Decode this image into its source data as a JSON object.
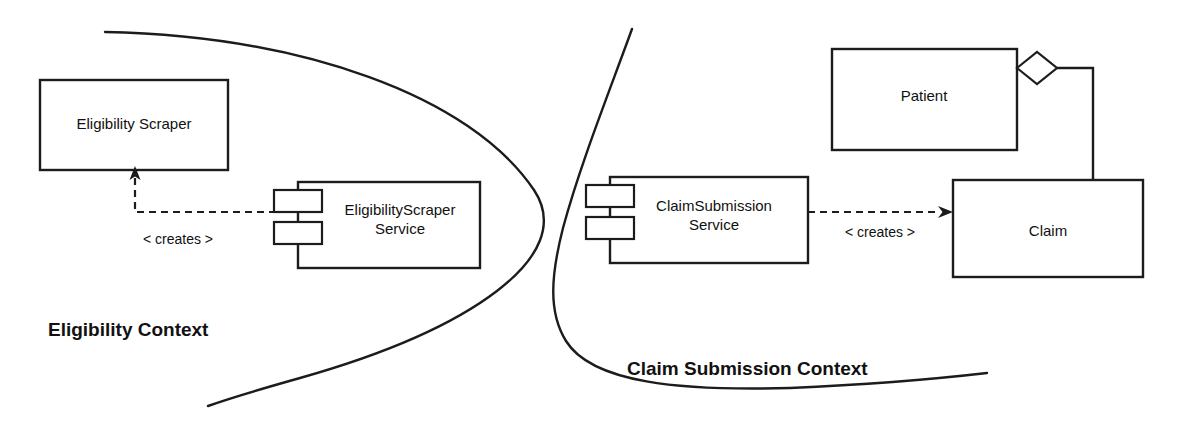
{
  "diagram": {
    "type": "uml-component-context-diagram",
    "background_color": "#ffffff",
    "line_color": "#1c1c1c",
    "contexts": [
      {
        "id": "eligibility",
        "label": "Eligibility Context",
        "label_x": 48,
        "label_y": 328
      },
      {
        "id": "claim-submission",
        "label": "Claim Submission Context",
        "label_x": 627,
        "label_y": 368
      }
    ],
    "nodes": [
      {
        "id": "eligibility-scraper",
        "kind": "class-box",
        "label": "Eligibility Scraper",
        "x": 40,
        "y": 80,
        "width": 188,
        "height": 90
      },
      {
        "id": "eligibility-scraper-service",
        "kind": "component",
        "label_line1": "EligibilityScraper",
        "label_line2": "Service",
        "x": 298,
        "y": 182,
        "width": 182,
        "height": 86
      },
      {
        "id": "claim-submission-service",
        "kind": "component",
        "label_line1": "ClaimSubmission",
        "label_line2": "Service",
        "x": 610,
        "y": 177,
        "width": 198,
        "height": 86
      },
      {
        "id": "patient",
        "kind": "class-box",
        "label": "Patient",
        "x": 832,
        "y": 49,
        "width": 185,
        "height": 101
      },
      {
        "id": "claim",
        "kind": "class-box",
        "label": "Claim",
        "x": 953,
        "y": 180,
        "width": 190,
        "height": 97
      }
    ],
    "edges": [
      {
        "id": "creates-eligibility",
        "kind": "dependency-dashed",
        "label": "< creates >",
        "label_x": 178,
        "label_y": 239,
        "from": "eligibility-scraper-service",
        "to": "eligibility-scraper"
      },
      {
        "id": "creates-claim",
        "kind": "dependency-dashed",
        "label": "< creates >",
        "label_x": 880,
        "label_y": 232,
        "from": "claim-submission-service",
        "to": "claim"
      },
      {
        "id": "patient-claim-aggregation",
        "kind": "aggregation",
        "label": "",
        "from": "patient",
        "to": "claim"
      }
    ]
  }
}
